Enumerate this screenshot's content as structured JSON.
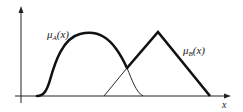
{
  "diagram": {
    "type": "fuzzy-membership-functions",
    "axes": {
      "x_label": "x",
      "y_label": ""
    },
    "functions": [
      {
        "name": "mu_A",
        "label_main": "μ",
        "label_sub": "A",
        "label_arg": "(x)",
        "shape": "bell / sigmoid-hump",
        "support_start": 37,
        "peak": 90,
        "support_end": 143
      },
      {
        "name": "mu_B",
        "label_main": "μ",
        "label_sub": "B",
        "label_arg": "(x)",
        "shape": "triangular",
        "support_start": 104,
        "peak": 158,
        "support_end": 210
      }
    ],
    "colors": {
      "stroke": "#111111",
      "background": "#ffffff"
    }
  }
}
